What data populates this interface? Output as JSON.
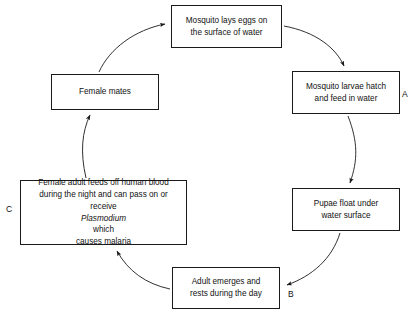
{
  "diagram": {
    "type": "cycle-flowchart",
    "direction": "clockwise",
    "stroke_color": "#1a1a1a",
    "background_color": "#ffffff",
    "nodes": [
      {
        "id": "eggs",
        "text": "Mosquito lays eggs on the surface of water",
        "line1": "Mosquito lays eggs on",
        "line2": "the surface of water"
      },
      {
        "id": "larvae",
        "text": "Mosquito larvae hatch and feed in water",
        "line1": "Mosquito larvae hatch",
        "line2": "and feed in water"
      },
      {
        "id": "pupae",
        "text": "Pupae float under water surface",
        "line1": "Pupae float under",
        "line2": "water surface"
      },
      {
        "id": "adult",
        "text": "Adult emerges and rests during the day",
        "line1": "Adult emerges and",
        "line2": "rests during the day"
      },
      {
        "id": "blood",
        "text": "Female adult feeds off human blood during the night and can pass on or receive Plasmodium which causes malaria",
        "line1": "Female adult feeds off human blood",
        "line2": "during the night and can pass on or",
        "line3_pre": "receive ",
        "line3_italic": "Plasmodium",
        "line3_post": " which",
        "line4": "causes malaria"
      },
      {
        "id": "female",
        "text": "Female mates",
        "line1": "Female mates"
      }
    ],
    "markers": [
      {
        "id": "a",
        "label": "A",
        "near_node": "larvae"
      },
      {
        "id": "b",
        "label": "B",
        "near_node": "adult"
      },
      {
        "id": "c",
        "label": "C",
        "near_node": "blood"
      }
    ],
    "edges": [
      {
        "from": "eggs",
        "to": "larvae"
      },
      {
        "from": "larvae",
        "to": "pupae"
      },
      {
        "from": "pupae",
        "to": "adult"
      },
      {
        "from": "adult",
        "to": "blood"
      },
      {
        "from": "blood",
        "to": "female"
      },
      {
        "from": "female",
        "to": "eggs"
      }
    ]
  }
}
